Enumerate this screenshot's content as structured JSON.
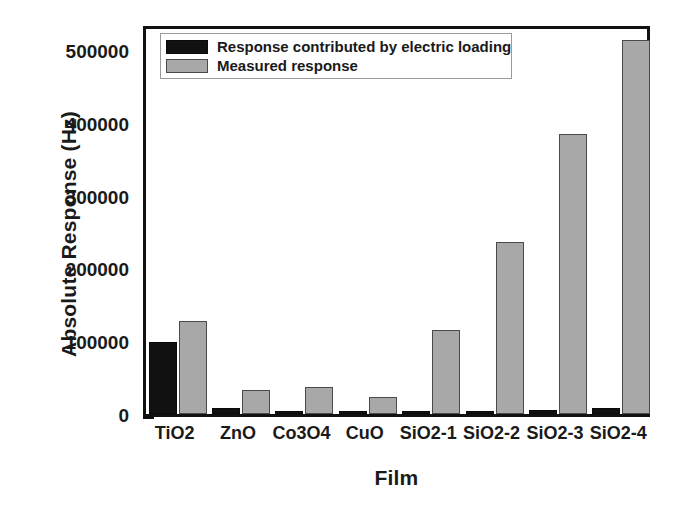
{
  "chart_data": {
    "type": "bar",
    "title": "",
    "xlabel": "Film",
    "ylabel": "Absolute Response (Hz)",
    "categories": [
      "TiO2",
      "ZnO",
      "Co3O4",
      "CuO",
      "SiO2-1",
      "SiO2-2",
      "SiO2-3",
      "SiO2-4"
    ],
    "series": [
      {
        "name": "Response contributed by electric loading",
        "color": "#111111",
        "values": [
          99000,
          8000,
          2000,
          2000,
          2000,
          3000,
          5000,
          8000
        ]
      },
      {
        "name": "Measured response",
        "color": "#a8a8a8",
        "values": [
          128000,
          33000,
          37000,
          24000,
          116000,
          236000,
          385000,
          513000
        ]
      }
    ],
    "ylim": [
      0,
      537000
    ],
    "ytick_labels": [
      "0",
      "100000",
      "200000",
      "300000",
      "400000",
      "500000"
    ],
    "ytick_values": [
      0,
      100000,
      200000,
      300000,
      400000,
      500000
    ],
    "yminor_values": [
      50000,
      150000,
      250000,
      350000,
      450000,
      500000
    ],
    "grid": false,
    "legend_position": "upper-left"
  },
  "legend": {
    "entries": [
      {
        "label": "Response contributed by electric loading",
        "swatch": "black-swatch"
      },
      {
        "label": "Measured response",
        "swatch": "gray-swatch"
      }
    ]
  }
}
